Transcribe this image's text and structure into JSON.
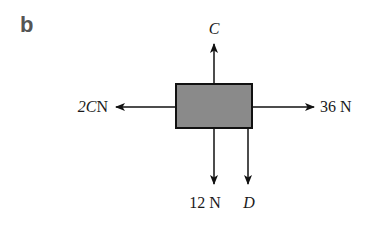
{
  "figure": {
    "part_label": "b",
    "box": {
      "fill": "#8a8a8a",
      "stroke": "#111111"
    },
    "forces": {
      "up": {
        "label": "C",
        "italic": true
      },
      "left": {
        "label_var": "2C",
        "label_unit": "N"
      },
      "right": {
        "label": "36 N"
      },
      "down_left": {
        "label": "12 N"
      },
      "down_right": {
        "label": "D",
        "italic": true
      }
    }
  }
}
